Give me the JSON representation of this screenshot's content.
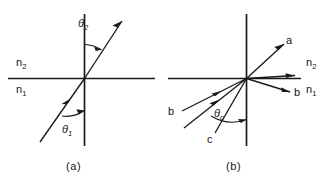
{
  "figure": {
    "panels": [
      {
        "id": "a",
        "caption": "(a)",
        "medium_upper": "n",
        "medium_upper_sub": "2",
        "medium_lower": "n",
        "medium_lower_sub": "1",
        "angles": [
          {
            "symbol": "θ",
            "sub": "2",
            "name": "refraction-angle"
          },
          {
            "symbol": "θ",
            "sub": "1",
            "name": "incidence-angle"
          }
        ]
      },
      {
        "id": "b",
        "caption": "(b)",
        "medium_upper": "n",
        "medium_upper_sub": "2",
        "medium_lower": "n",
        "medium_lower_sub": "1",
        "ray_labels": [
          {
            "text": "a",
            "name": "ray-label-a-transmitted"
          },
          {
            "text": "b",
            "name": "ray-label-b-right"
          },
          {
            "text": "b",
            "name": "ray-label-b-left"
          },
          {
            "text": "c",
            "name": "ray-label-c"
          }
        ],
        "angles": [
          {
            "symbol": "θ",
            "sub": "c",
            "name": "critical-angle"
          }
        ]
      }
    ]
  }
}
